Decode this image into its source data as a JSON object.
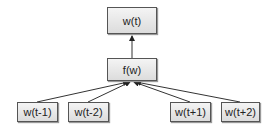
{
  "diagram": {
    "output_node": {
      "label": "w(t)"
    },
    "function_node": {
      "label": "f(w)"
    },
    "context_nodes": [
      {
        "label": "w(t-1)"
      },
      {
        "label": "w(t-2)"
      },
      {
        "label": "w(t+1)"
      },
      {
        "label": "w(t+2)"
      }
    ],
    "edges": [
      {
        "from": "w(t-1)",
        "to": "f(w)"
      },
      {
        "from": "w(t-2)",
        "to": "f(w)"
      },
      {
        "from": "w(t+1)",
        "to": "f(w)"
      },
      {
        "from": "w(t+2)",
        "to": "f(w)"
      },
      {
        "from": "f(w)",
        "to": "w(t)"
      }
    ]
  }
}
